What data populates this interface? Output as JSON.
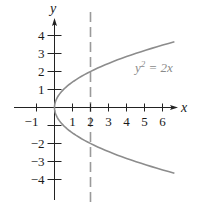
{
  "chart_data": {
    "type": "line",
    "title": "",
    "xlabel": "x",
    "ylabel": "y",
    "xlim": [
      -1.2,
      6.8
    ],
    "ylim": [
      -4.6,
      4.7
    ],
    "x_ticks": [
      -1,
      1,
      2,
      3,
      4,
      5,
      6
    ],
    "y_ticks": [
      -4,
      -3,
      -2,
      -1,
      1,
      2,
      3,
      4
    ],
    "x_tick_labels": [
      "−1",
      "1",
      "2",
      "3",
      "4",
      "5",
      "6"
    ],
    "y_tick_labels": [
      "−4",
      "−3",
      "−2",
      "1",
      "2",
      "3",
      "4"
    ],
    "series": [
      {
        "name": "y^2 = 2x",
        "label": "y² = 2x",
        "kind": "parabola",
        "equation": "y^2 = 2x",
        "y_range": [
          -3.65,
          3.65
        ],
        "color": "#8c8c8c"
      },
      {
        "name": "x = 2",
        "kind": "vertical-dashed-line",
        "x": 2,
        "color": "#9a9a9a"
      }
    ],
    "annotations": [
      {
        "text": "y² = 2x",
        "x": 4.8,
        "y": 2.3
      }
    ],
    "grid": false,
    "legend": "none"
  },
  "labels": {
    "x_axis": "x",
    "y_axis": "y",
    "equation": "y",
    "equation_exp": "2",
    "equation_rhs": " = 2x"
  }
}
